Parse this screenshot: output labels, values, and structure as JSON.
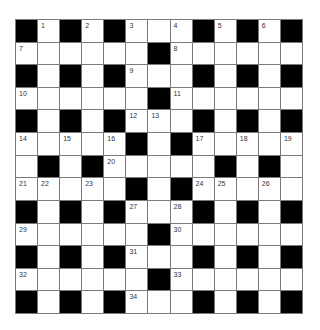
{
  "puzzle": {
    "rows": 13,
    "cols": 13,
    "colors": {
      "block": "#000000",
      "cell": "#ffffff",
      "gridline": "#7a7a7a",
      "number": "#333333"
    },
    "grid": [
      [
        "#",
        "1",
        "#",
        "2",
        "#",
        "3",
        "",
        "4",
        "#",
        "5",
        "#",
        "6",
        "#"
      ],
      [
        "7",
        "",
        "",
        "",
        "",
        "",
        "#",
        "8",
        "",
        "",
        "",
        "",
        ""
      ],
      [
        "#",
        "",
        "#",
        "",
        "#",
        "9",
        "",
        "",
        "#",
        "",
        "#",
        "",
        "#"
      ],
      [
        "10",
        "",
        "",
        "",
        "",
        "",
        "#",
        "11",
        "",
        "",
        "",
        "",
        ""
      ],
      [
        "#",
        "",
        "#",
        "",
        "#",
        "12",
        "13",
        "",
        "#",
        "",
        "#",
        "",
        "#"
      ],
      [
        "14",
        "",
        "15",
        "",
        "16",
        "#",
        "",
        "#",
        "17",
        "",
        "18",
        "",
        "19"
      ],
      [
        "",
        "#",
        "",
        "#",
        "20",
        "",
        "",
        "",
        "",
        "#",
        "",
        "#",
        ""
      ],
      [
        "21",
        "22",
        "",
        "23",
        "",
        "#",
        "",
        "#",
        "24",
        "25",
        "",
        "26",
        ""
      ],
      [
        "#",
        "",
        "#",
        "",
        "#",
        "27",
        "",
        "28",
        "#",
        "",
        "#",
        "",
        "#"
      ],
      [
        "29",
        "",
        "",
        "",
        "",
        "",
        "#",
        "30",
        "",
        "",
        "",
        "",
        ""
      ],
      [
        "#",
        "",
        "#",
        "",
        "#",
        "31",
        "",
        "",
        "#",
        "",
        "#",
        "",
        "#"
      ],
      [
        "32",
        "",
        "",
        "",
        "",
        "",
        "#",
        "33",
        "",
        "",
        "",
        "",
        ""
      ],
      [
        "#",
        "",
        "#",
        "",
        "#",
        "34",
        "",
        "",
        "#",
        "",
        "#",
        "",
        "#"
      ]
    ]
  }
}
